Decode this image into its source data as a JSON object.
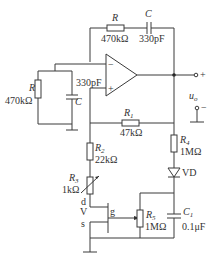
{
  "diagram": {
    "type": "circuit-schematic",
    "components": {
      "R_fb": {
        "name": "R",
        "value": "470kΩ"
      },
      "C_fb": {
        "name": "C",
        "value": "330pF"
      },
      "R_gnd": {
        "name": "R",
        "value": "470kΩ"
      },
      "C_gnd": {
        "name": "C",
        "value": "330pF"
      },
      "R1": {
        "name": "R",
        "sub": "1",
        "value": "47kΩ"
      },
      "R2": {
        "name": "R",
        "sub": "2",
        "value": "22kΩ"
      },
      "R3": {
        "name": "R",
        "sub": "3",
        "value": "1kΩ"
      },
      "R4": {
        "name": "R",
        "sub": "4",
        "value": "1MΩ"
      },
      "R5": {
        "name": "R",
        "sub": "5",
        "value": "1MΩ"
      },
      "C1": {
        "name": "C",
        "sub": "1",
        "value": "0.1μF"
      },
      "VD": {
        "name": "VD"
      },
      "V": {
        "name": "V",
        "drain": "d",
        "gate": "g",
        "source": "s"
      }
    },
    "opamp": {
      "inv": "−",
      "noninv": "+"
    },
    "output": {
      "label": "u",
      "sub": "o",
      "plus": "+",
      "minus": "−"
    }
  }
}
